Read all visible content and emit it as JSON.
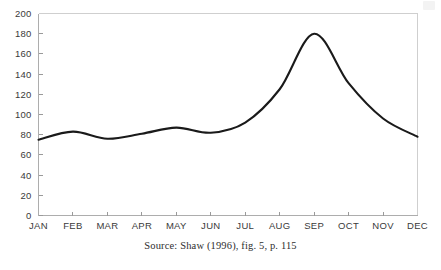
{
  "caption": "Source: Shaw (1996), fig. 5, p. 115",
  "colors": {
    "line": "#1a1a1a",
    "axis": "#adadad",
    "frame": "#cfcfcf",
    "tick": "#9a9a9a",
    "label": "#3a3a3a",
    "background": "#ffffff"
  },
  "chart_data": {
    "type": "line",
    "title": "",
    "subtitle": "",
    "xlabel": "",
    "ylabel": "",
    "categories": [
      "JAN",
      "FEB",
      "MAR",
      "APR",
      "MAY",
      "JUN",
      "JUL",
      "AUG",
      "SEP",
      "OCT",
      "NOV",
      "DEC"
    ],
    "values": [
      75,
      83,
      76,
      81,
      87,
      82,
      92,
      125,
      180,
      131,
      96,
      78
    ],
    "series": [
      {
        "name": "",
        "values": [
          75,
          83,
          76,
          81,
          87,
          82,
          92,
          125,
          180,
          131,
          96,
          78
        ]
      }
    ],
    "ylim": [
      0,
      200
    ],
    "ytick_labels": [
      "0",
      "20",
      "40",
      "60",
      "80",
      "100",
      "120",
      "140",
      "160",
      "180",
      "200"
    ],
    "ytick_values": [
      0,
      20,
      40,
      60,
      80,
      100,
      120,
      140,
      160,
      180,
      200
    ],
    "ytick_step": 20,
    "xtick_labels": [
      "JAN",
      "FEB",
      "MAR",
      "APR",
      "MAY",
      "JUN",
      "JUL",
      "AUG",
      "SEP",
      "OCT",
      "NOV",
      "DEC"
    ],
    "grid": false,
    "legend": false,
    "legend_position": "none",
    "smooth": true,
    "annotations": []
  }
}
